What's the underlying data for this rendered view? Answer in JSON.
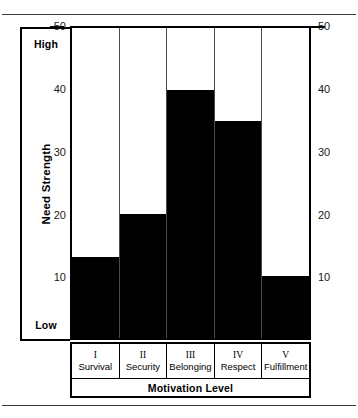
{
  "chart_data": {
    "type": "bar",
    "title": "",
    "categories": [
      "Survival",
      "Security",
      "Belonging",
      "Respect",
      "Fulfillment"
    ],
    "category_numerals": [
      "I",
      "II",
      "III",
      "IV",
      "V"
    ],
    "values": [
      13,
      20,
      40,
      35,
      10
    ],
    "xlabel": "Motivation Level",
    "ylabel": "Need Strength",
    "ylim": [
      0,
      50
    ],
    "yticks": [
      10,
      20,
      30,
      40,
      50
    ],
    "ytick_labels": [
      "10",
      "20",
      "30",
      "40",
      "50"
    ],
    "y_axis_low_label": "Low",
    "y_axis_high_label": "High",
    "grid": false,
    "legend": false,
    "bar_color": "#000000",
    "plot_background": "#ffffff",
    "axis_color": "#000000",
    "dual_y_axis": true
  },
  "axis": {
    "high": "High",
    "low": "Low",
    "ylabel": "Need Strength",
    "xlabel": "Motivation Level"
  },
  "ticks": {
    "left": [
      "50",
      "40",
      "30",
      "20",
      "10"
    ],
    "right": [
      "50",
      "40",
      "30",
      "20",
      "10"
    ]
  },
  "categories": [
    {
      "numeral": "I",
      "name": "Survival"
    },
    {
      "numeral": "II",
      "name": "Security"
    },
    {
      "numeral": "III",
      "name": "Belonging"
    },
    {
      "numeral": "IV",
      "name": "Respect"
    },
    {
      "numeral": "V",
      "name": "Fulfillment"
    }
  ]
}
